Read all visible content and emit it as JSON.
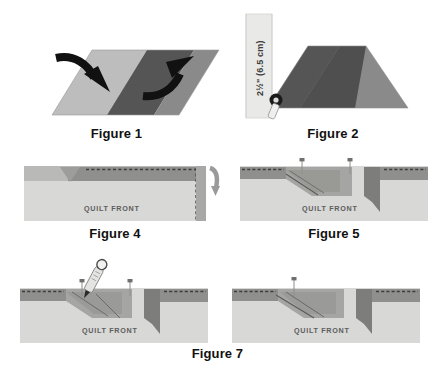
{
  "document": {
    "type": "quilting-instruction-diagram",
    "title": "Quilt Binding Mitered Corner Steps"
  },
  "palette": {
    "light_gray": "#bdbdbd",
    "mid_gray": "#8a8a8a",
    "dark_gray": "#555555",
    "darker_gray": "#4a4a4a",
    "quilt_front_fill": "#d8d8d6",
    "quilt_band_fill": "#b9b9b7",
    "ruler_fill": "#e9e9e7",
    "stitch_line": "#3d3d3d",
    "arrow_black": "#111111",
    "caption_color": "#111111",
    "background": "#ffffff"
  },
  "figures": [
    {
      "id": "figure-1",
      "caption": "Figure 1",
      "description": "Parallelogram binding strip with two fold arrows",
      "panels": [
        "left-light-panel",
        "center-dark-panel",
        "right-mid-panel"
      ],
      "arrows": [
        {
          "name": "fold-arrow-left",
          "direction": "down-right"
        },
        {
          "name": "fold-arrow-right",
          "direction": "up-right"
        }
      ]
    },
    {
      "id": "figure-2",
      "caption": "Figure 2",
      "description": "Folded strip measured against a ruler with marking pen",
      "measurement": "2½\" (6.5 cm)",
      "tools": [
        "ruler",
        "marking-pen"
      ]
    },
    {
      "id": "figure-4",
      "caption": "Figure 4",
      "description": "Quilt front cross section with binding band, notch and fold arrow",
      "quilt_label": "QUILT FRONT",
      "arrows": [
        {
          "name": "fold-down-arrow",
          "direction": "down"
        }
      ]
    },
    {
      "id": "figure-5",
      "caption": "Figure 5",
      "description": "Quilt front with angled binding seam, pins and corner flap",
      "quilt_label": "QUILT FRONT",
      "pins": 2
    },
    {
      "id": "figure-6",
      "caption": "",
      "description": "Quilt front with marking pen drawing the stitch line, pins placed",
      "quilt_label": "QUILT FRONT",
      "pins": 2,
      "tools": [
        "marking-pen"
      ]
    },
    {
      "id": "figure-7",
      "caption": "Figure 7",
      "description": "Quilt front with completed marked seam line and pin",
      "quilt_label": "QUILT FRONT",
      "pins": 1
    }
  ],
  "captions": {
    "figure_1": "Figure 1",
    "figure_2": "Figure 2",
    "figure_4": "Figure 4",
    "figure_5": "Figure 5",
    "figure_7": "Figure 7"
  },
  "labels": {
    "quilt_front": "QUILT FRONT",
    "measurement": "2½\" (6.5 cm)"
  }
}
